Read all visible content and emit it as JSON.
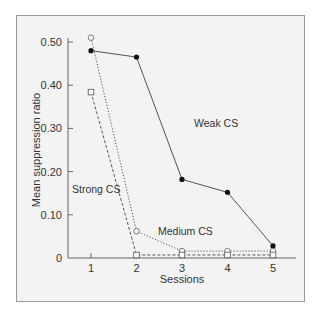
{
  "chart_data": {
    "type": "line",
    "title": "",
    "xlabel": "Sessions",
    "ylabel": "Mean suppression ratio",
    "x": [
      1,
      2,
      3,
      4,
      5
    ],
    "x_tick_labels": [
      "1",
      "2",
      "3",
      "4",
      "5"
    ],
    "y_ticks": [
      0,
      0.1,
      0.2,
      0.3,
      0.4,
      0.5
    ],
    "y_tick_labels": [
      "0",
      "0.10",
      "0.20",
      "0.30",
      "0.40",
      "0.50"
    ],
    "ylim": [
      0,
      0.5
    ],
    "grid": false,
    "legend": "inline labels",
    "series": [
      {
        "name": "Weak CS",
        "marker": "filled-circle",
        "line": "solid",
        "values": [
          0.48,
          0.465,
          0.182,
          0.152,
          0.028
        ]
      },
      {
        "name": "Medium CS",
        "marker": "open-circle",
        "line": "dotted",
        "values": [
          0.51,
          0.062,
          0.016,
          0.016,
          0.016
        ]
      },
      {
        "name": "Strong CS",
        "marker": "open-square",
        "line": "dashed",
        "values": [
          0.384,
          0.007,
          0.007,
          0.007,
          0.007
        ]
      }
    ]
  },
  "colors": {
    "line": "#555555",
    "marker_fill": "#111111",
    "background": "#f3f3f3",
    "frame": "#9a9a9a",
    "axis": "#666666"
  }
}
